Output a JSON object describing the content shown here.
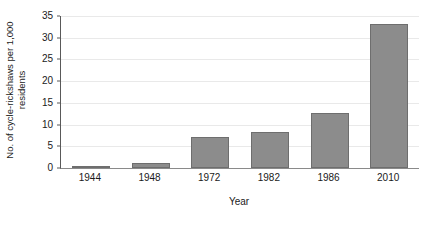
{
  "chart_data": {
    "type": "bar",
    "title": "",
    "subtitle": "",
    "categories": [
      "1944",
      "1948",
      "1972",
      "1982",
      "1986",
      "2010"
    ],
    "values": [
      0.3,
      1.2,
      7.1,
      8.4,
      12.7,
      33.1
    ],
    "xlabel": "Year",
    "ylabel_lines": [
      "No. of cycle-rickshaws per 1,000",
      "residents"
    ],
    "ylabel": "No. of cycle-rickshaws per 1,000 residents",
    "ylim": [
      0,
      35
    ],
    "yticks": [
      0,
      5,
      10,
      15,
      20,
      25,
      30,
      35
    ],
    "ytick_labels": [
      "0",
      "5",
      "10",
      "15",
      "20",
      "25",
      "30",
      "35"
    ],
    "grid": true,
    "grid_axis": "y",
    "legend": false,
    "legend_position": "none",
    "colors": {
      "bar_fill": "#8c8c8c",
      "bar_border": "#6e6e6e",
      "gridline": "#e9e9e9",
      "axis": "#595959",
      "text": "#1a1a1a",
      "background": "#ffffff"
    }
  }
}
